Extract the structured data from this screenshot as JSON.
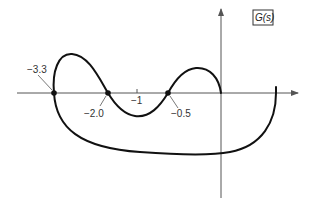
{
  "diagram": {
    "type": "nyquist-plot",
    "title_label": "G(s)",
    "axes": {
      "real_axis": "horizontal",
      "imaginary_axis": "vertical",
      "tick_label": "−1"
    },
    "crossing_points": [
      {
        "value": -3.3,
        "label": "−3.3"
      },
      {
        "value": -2.0,
        "label": "−2.0"
      },
      {
        "value": -0.5,
        "label": "−0.5"
      }
    ],
    "colors": {
      "curve": "#111111",
      "axes": "#555555"
    }
  }
}
